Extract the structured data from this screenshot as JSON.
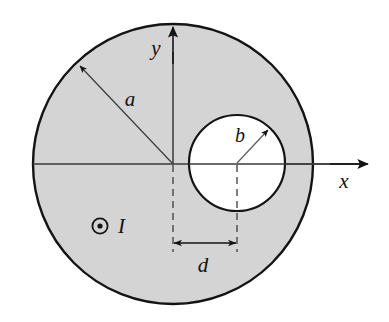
{
  "figure": {
    "background_color": "#ffffff",
    "shading_color": "#d4d4d4",
    "stroke_color": "#141414",
    "thin_stroke_color": "#4a4a4a"
  },
  "shapes": {
    "outer_circle": {
      "name": "conductor-outer-boundary",
      "center_x": 173,
      "center_y": 164,
      "radius": 140,
      "fill": "#d4d4d4",
      "stroke": "#141414",
      "stroke_width": 2.4
    },
    "inner_circle": {
      "name": "cavity-boundary",
      "center_x": 237,
      "center_y": 163,
      "radius": 48,
      "fill": "#ffffff",
      "stroke": "#141414",
      "stroke_width": 2.2
    }
  },
  "axes": {
    "origin_x": 173,
    "origin_y": 164,
    "x_axis": {
      "label": "x",
      "label_x": 344,
      "label_y": 188,
      "start_x": 33,
      "end_x": 368,
      "y": 164
    },
    "y_axis": {
      "label": "y",
      "label_x": 156,
      "label_y": 55,
      "x": 173,
      "start_y": 164,
      "end_y": 28
    }
  },
  "annotations": {
    "radius_a": {
      "label": "a",
      "label_x": 130,
      "label_y": 106,
      "from_x": 173,
      "from_y": 164,
      "to_x": 80,
      "to_y": 66
    },
    "radius_b": {
      "label": "b",
      "label_x": 240,
      "label_y": 142,
      "from_x": 237,
      "from_y": 163,
      "to_x": 268,
      "to_y": 130
    },
    "current": {
      "symbol": "out-of-page-dot",
      "label": "I",
      "symbol_x": 100,
      "symbol_y": 226,
      "label_x": 118,
      "label_y": 233
    },
    "offset_d": {
      "label": "d",
      "label_x": 198,
      "label_y": 272,
      "dim_line_y": 243,
      "left_x": 173,
      "right_x": 237,
      "extension_top_y": 165,
      "extension_bottom_y": 252
    }
  }
}
